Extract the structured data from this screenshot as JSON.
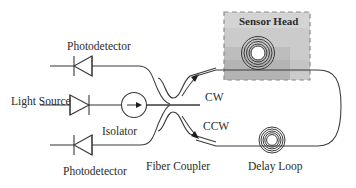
{
  "figure": {
    "type": "schematic-diagram",
    "background_color": "#ffffff",
    "line_color": "#3a3a3a",
    "text_color": "#2b2b2b"
  },
  "labels": {
    "photodetector_top": "Photodetector",
    "photodetector_bottom": "Photodetector",
    "light_source": "Light Source",
    "isolator": "Isolator",
    "fiber_coupler": "Fiber Coupler",
    "delay_loop": "Delay Loop",
    "sensor_head": "Sensor Head",
    "cw": "CW",
    "ccw": "CCW"
  },
  "components": {
    "sensor_head_box": {
      "label": "Sensor Head",
      "border_style": "dashed",
      "border_color": "#8c8c8c",
      "fill_colors": [
        "#d6d6d6",
        "#c9c9c9",
        "#bfbfbf",
        "#b5b5b5"
      ]
    },
    "sensor_coil": {
      "rings": 5,
      "name": "sensing-fiber-coil"
    },
    "delay_loop_coil": {
      "rings": 5,
      "name": "delay-loop-coil"
    },
    "isolator_symbol": {
      "shape": "circle-with-right-arrow"
    },
    "light_source_diode": {
      "direction": "right"
    },
    "photodetector_top_diode": {
      "direction": "left"
    },
    "photodetector_bottom_diode": {
      "direction": "left"
    },
    "coupler_symbol": {
      "shape": "crossed-s-curves-with-bar"
    }
  },
  "propagation": {
    "cw_arrow": "clockwise",
    "ccw_arrow": "counter-clockwise"
  }
}
